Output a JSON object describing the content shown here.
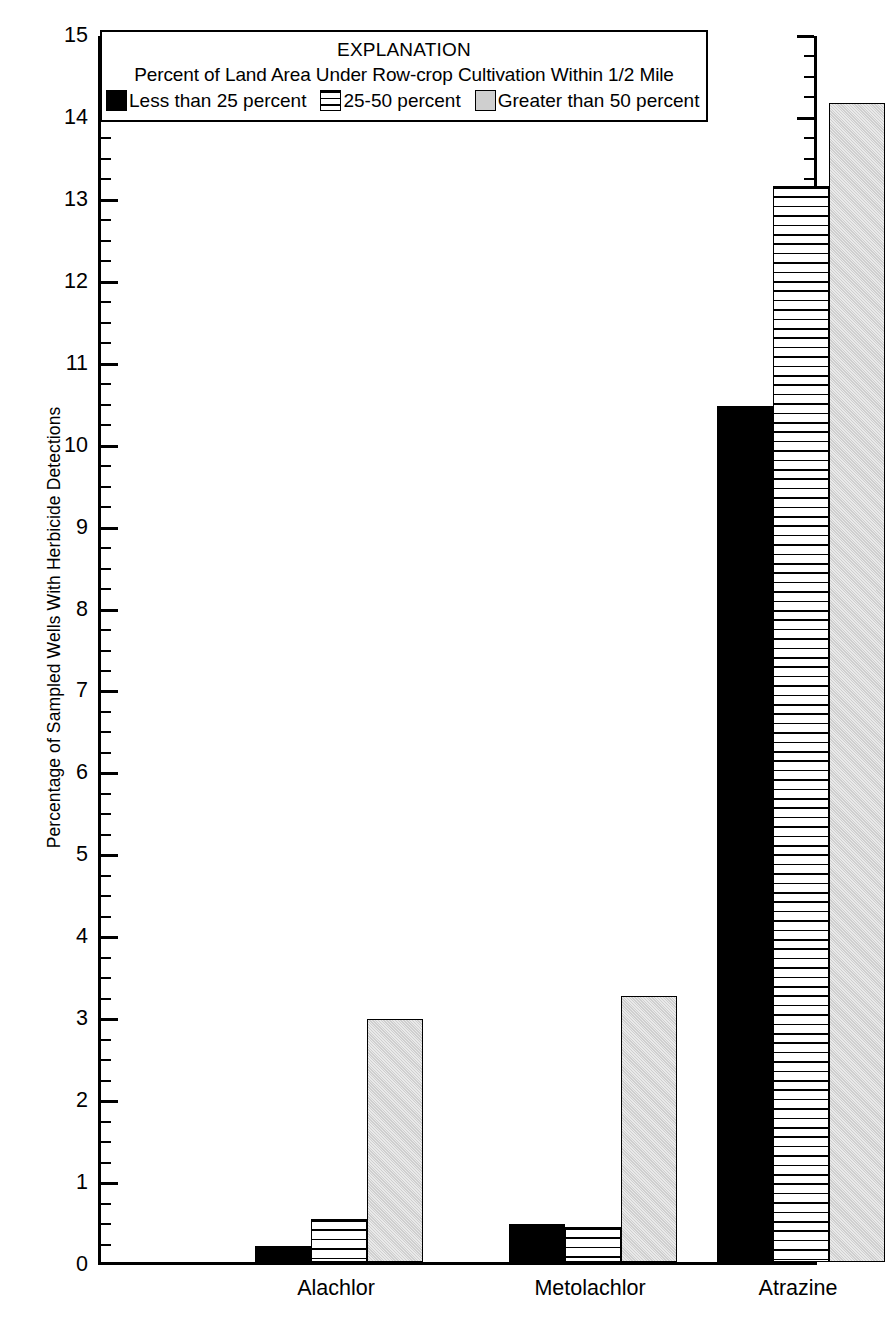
{
  "chart_data": {
    "type": "bar",
    "title": "",
    "xlabel": "",
    "ylabel": "Percentage of Sampled Wells With Herbicide Detections",
    "ylim": [
      0,
      15
    ],
    "ytick_step": 1,
    "yminor_step": 0.25,
    "grid": false,
    "legend_position": "top-center-inside",
    "categories": [
      "Alachlor",
      "Metolachlor",
      "Atrazine"
    ],
    "ytick_labels": [
      "0",
      "1",
      "2",
      "3",
      "4",
      "5",
      "6",
      "7",
      "8",
      "9",
      "10",
      "11",
      "12",
      "13",
      "14",
      "15"
    ],
    "series": [
      {
        "name": "Less than 25 percent",
        "pattern": "solid",
        "color": "#000000",
        "values": [
          0.2,
          0.47,
          10.45
        ]
      },
      {
        "name": "25-50 percent",
        "pattern": "horizontal-hatch",
        "color": "#ffffff",
        "values": [
          0.53,
          0.43,
          13.13
        ]
      },
      {
        "name": "Greater than 50 percent",
        "pattern": "light-gray-stipple",
        "color": "#cfcfcf",
        "values": [
          2.97,
          3.25,
          14.15
        ]
      }
    ],
    "legend": {
      "title": "EXPLANATION",
      "subtitle": "Percent of Land Area Under Row-crop Cultivation Within 1/2 Mile",
      "entries": [
        {
          "label": "Less than 25 percent",
          "key": "solid"
        },
        {
          "label": "25-50 percent",
          "key": "hatch"
        },
        {
          "label": "Greater than 50 percent",
          "key": "gray"
        }
      ]
    }
  },
  "axis": {
    "y_title": "Percentage of Sampled Wells With Herbicide Detections"
  }
}
